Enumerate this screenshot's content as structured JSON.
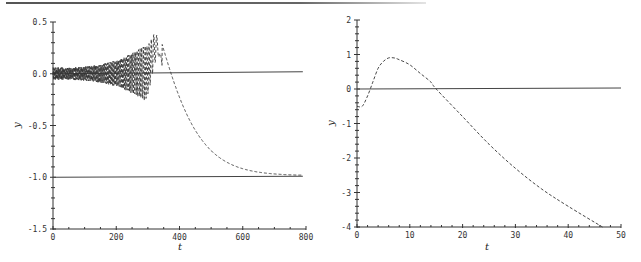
{
  "chart_data": [
    {
      "type": "line",
      "title": "",
      "xlabel": "t",
      "ylabel": "y",
      "xlim": [
        0,
        800
      ],
      "ylim": [
        -1.5,
        0.5
      ],
      "xticks": [
        "0",
        "200",
        "400",
        "600",
        "800"
      ],
      "yticks": [
        "0.5",
        "0.0",
        "-0.5",
        "-1.0",
        "-1.5"
      ],
      "grid": false,
      "legend": null,
      "series": [
        {
          "name": "solution (dashed)",
          "style": "dashed",
          "description": "Growing oscillation around 0 then decay to -1",
          "x": [
            0,
            50,
            100,
            150,
            180,
            200,
            230,
            250,
            275,
            300,
            320,
            340,
            360,
            380,
            400,
            420,
            450,
            480,
            520,
            560,
            600,
            650,
            700,
            750,
            790
          ],
          "y": [
            0.0,
            0.08,
            -0.1,
            0.15,
            -0.18,
            0.2,
            -0.22,
            0.24,
            -0.3,
            0.25,
            0.41,
            0.3,
            -0.05,
            -0.35,
            -0.55,
            -0.7,
            -0.82,
            -0.9,
            -0.95,
            -0.97,
            -0.985,
            -0.99,
            -0.995,
            -0.997,
            -0.998
          ]
        },
        {
          "name": "y = 0",
          "style": "solid",
          "x": [
            0,
            790
          ],
          "y": [
            0.0,
            0.0
          ]
        },
        {
          "name": "y = -1",
          "style": "solid",
          "x": [
            0,
            790
          ],
          "y": [
            -1.0,
            -1.0
          ]
        }
      ]
    },
    {
      "type": "line",
      "title": "",
      "xlabel": "t",
      "ylabel": "y",
      "xlim": [
        0,
        50
      ],
      "ylim": [
        -4,
        2
      ],
      "xticks": [
        "0",
        "10",
        "20",
        "30",
        "40",
        "50"
      ],
      "yticks": [
        "2",
        "1",
        "0",
        "-1",
        "-2",
        "-3",
        "-4"
      ],
      "grid": false,
      "legend": null,
      "series": [
        {
          "name": "solution (dashed)",
          "style": "dashed",
          "x": [
            0,
            1,
            2,
            3,
            4,
            5,
            6,
            7,
            8,
            10,
            12,
            14,
            15,
            20,
            25,
            30,
            35,
            40,
            46.5
          ],
          "y": [
            -0.5,
            -0.5,
            -0.2,
            0.2,
            0.6,
            0.8,
            0.9,
            0.9,
            0.85,
            0.7,
            0.45,
            0.2,
            0.0,
            -0.8,
            -1.6,
            -2.3,
            -2.9,
            -3.4,
            -4.0
          ]
        },
        {
          "name": "y = 0",
          "style": "solid",
          "x": [
            0,
            50
          ],
          "y": [
            0.0,
            0.0
          ]
        }
      ]
    }
  ],
  "left": {
    "xlabel": "t",
    "ylabel": "y",
    "xticks": [
      "0",
      "200",
      "400",
      "600",
      "800"
    ],
    "yticks": [
      "0.5",
      "0.0",
      "-0.5",
      "-1.0",
      "-1.5"
    ]
  },
  "right": {
    "xlabel": "t",
    "ylabel": "y",
    "xticks": [
      "0",
      "10",
      "20",
      "30",
      "40",
      "50"
    ],
    "yticks": [
      "2",
      "1",
      "0",
      "-1",
      "-2",
      "-3",
      "-4"
    ]
  }
}
